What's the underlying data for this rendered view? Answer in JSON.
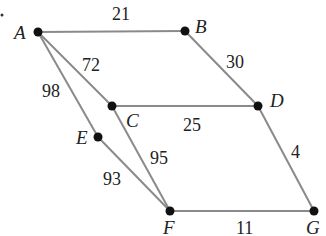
{
  "diagram": {
    "type": "weighted-graph",
    "nodes": [
      {
        "id": "A",
        "label": "A",
        "x": 38,
        "y": 32,
        "lx": 14,
        "ly": 39
      },
      {
        "id": "B",
        "label": "B",
        "x": 185,
        "y": 31,
        "lx": 195,
        "ly": 33
      },
      {
        "id": "C",
        "label": "C",
        "x": 112,
        "y": 106,
        "lx": 126,
        "ly": 127
      },
      {
        "id": "D",
        "label": "D",
        "x": 258,
        "y": 106,
        "lx": 270,
        "ly": 107
      },
      {
        "id": "E",
        "label": "E",
        "x": 98,
        "y": 137,
        "lx": 76,
        "ly": 144
      },
      {
        "id": "F",
        "label": "F",
        "x": 170,
        "y": 211,
        "lx": 163,
        "ly": 234
      },
      {
        "id": "G",
        "label": "G",
        "x": 314,
        "y": 211,
        "lx": 306,
        "ly": 234
      }
    ],
    "edges": [
      {
        "from": "A",
        "to": "B",
        "weight": "21",
        "lx": 112,
        "ly": 20
      },
      {
        "from": "A",
        "to": "C",
        "weight": "72",
        "lx": 82,
        "ly": 71
      },
      {
        "from": "A",
        "to": "E",
        "weight": "98",
        "lx": 42,
        "ly": 97
      },
      {
        "from": "B",
        "to": "D",
        "weight": "30",
        "lx": 226,
        "ly": 68
      },
      {
        "from": "C",
        "to": "D",
        "weight": "25",
        "lx": 183,
        "ly": 131
      },
      {
        "from": "C",
        "to": "F",
        "weight": "95",
        "lx": 150,
        "ly": 164
      },
      {
        "from": "E",
        "to": "F",
        "weight": "93",
        "lx": 103,
        "ly": 185
      },
      {
        "from": "D",
        "to": "G",
        "weight": "4",
        "lx": 291,
        "ly": 158
      },
      {
        "from": "F",
        "to": "G",
        "weight": "11",
        "lx": 236,
        "ly": 234
      }
    ],
    "stray_mark": {
      "x": 2,
      "y": 15
    }
  }
}
